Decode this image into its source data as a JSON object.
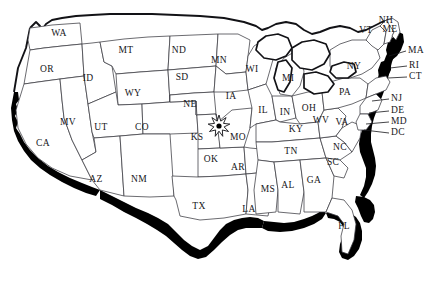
{
  "figure": {
    "kind": "map",
    "region": "Contiguous United States",
    "style": "black-and-white outline map with shaded coastal border band",
    "background_color": "#ffffff",
    "border_color": "#3a3a40",
    "outline_color": "#121216",
    "shade_color": "#000000",
    "label_color": "#16161a"
  },
  "watermark": {
    "text": "",
    "visible": true
  },
  "marker": {
    "name": "starburst-marker",
    "shape": "star-burst with filled center dot",
    "label": "",
    "near": "KS / MO border",
    "x": 219,
    "y": 126,
    "dot_color": "#000000"
  },
  "states": [
    {
      "code": "WA",
      "x": 59,
      "y": 34
    },
    {
      "code": "OR",
      "x": 47,
      "y": 70
    },
    {
      "code": "ID",
      "x": 88,
      "y": 79
    },
    {
      "code": "MT",
      "x": 126,
      "y": 51
    },
    {
      "code": "ND",
      "x": 179,
      "y": 51
    },
    {
      "code": "SD",
      "x": 182,
      "y": 78
    },
    {
      "code": "NE",
      "x": 190,
      "y": 105
    },
    {
      "code": "WY",
      "x": 133,
      "y": 94
    },
    {
      "code": "MV",
      "x": 68,
      "y": 123
    },
    {
      "code": "UT",
      "x": 101,
      "y": 128
    },
    {
      "code": "CO",
      "x": 142,
      "y": 128
    },
    {
      "code": "CA",
      "x": 43,
      "y": 144
    },
    {
      "code": "AZ",
      "x": 96,
      "y": 180
    },
    {
      "code": "NM",
      "x": 139,
      "y": 180
    },
    {
      "code": "KS",
      "x": 197,
      "y": 138
    },
    {
      "code": "OK",
      "x": 211,
      "y": 160
    },
    {
      "code": "TX",
      "x": 199,
      "y": 207
    },
    {
      "code": "MN",
      "x": 219,
      "y": 61
    },
    {
      "code": "IA",
      "x": 231,
      "y": 97
    },
    {
      "code": "MO",
      "x": 238,
      "y": 138
    },
    {
      "code": "AR",
      "x": 238,
      "y": 168
    },
    {
      "code": "LA",
      "x": 249,
      "y": 210
    },
    {
      "code": "WI",
      "x": 252,
      "y": 70
    },
    {
      "code": "IL",
      "x": 263,
      "y": 111
    },
    {
      "code": "MI",
      "x": 288,
      "y": 79
    },
    {
      "code": "IN",
      "x": 285,
      "y": 113
    },
    {
      "code": "OH",
      "x": 309,
      "y": 109
    },
    {
      "code": "KY",
      "x": 296,
      "y": 130
    },
    {
      "code": "TN",
      "x": 291,
      "y": 152
    },
    {
      "code": "MS",
      "x": 268,
      "y": 190
    },
    {
      "code": "AL",
      "x": 288,
      "y": 186
    },
    {
      "code": "GA",
      "x": 314,
      "y": 181
    },
    {
      "code": "FL",
      "x": 344,
      "y": 227
    },
    {
      "code": "SC",
      "x": 333,
      "y": 163
    },
    {
      "code": "NC",
      "x": 340,
      "y": 148
    },
    {
      "code": "WV",
      "x": 321,
      "y": 121
    },
    {
      "code": "VA",
      "x": 342,
      "y": 123
    },
    {
      "code": "PA",
      "x": 345,
      "y": 93
    },
    {
      "code": "NY",
      "x": 354,
      "y": 67
    },
    {
      "code": "VT",
      "x": 366,
      "y": 31
    },
    {
      "code": "NH",
      "x": 386,
      "y": 21
    },
    {
      "code": "ME",
      "x": 390,
      "y": 30
    }
  ],
  "callouts": [
    {
      "code": "MA",
      "label_x": 408,
      "label_y": 51,
      "leader": "M 406 51 L 389 56"
    },
    {
      "code": "RI",
      "label_x": 409,
      "label_y": 66,
      "leader": "M 407 66 L 390 68"
    },
    {
      "code": "CT",
      "label_x": 409,
      "label_y": 77,
      "leader": "M 407 77 L 388 78"
    },
    {
      "code": "NJ",
      "label_x": 391,
      "label_y": 99,
      "leader": "M 389 99 L 372 101"
    },
    {
      "code": "DE",
      "label_x": 391,
      "label_y": 111,
      "leader": "M 389 111 L 369 113"
    },
    {
      "code": "MD",
      "label_x": 391,
      "label_y": 122,
      "leader": "M 389 122 L 366 124"
    },
    {
      "code": "DC",
      "label_x": 391,
      "label_y": 133,
      "leader": "M 389 133 L 364 130"
    }
  ],
  "chart_data": {
    "type": "map",
    "title": "",
    "projection": "generic US contiguous outline",
    "label_count": 49,
    "labels": [
      "WA",
      "OR",
      "ID",
      "MT",
      "ND",
      "SD",
      "NE",
      "WY",
      "MV",
      "UT",
      "CO",
      "CA",
      "AZ",
      "NM",
      "KS",
      "OK",
      "TX",
      "MN",
      "IA",
      "MO",
      "AR",
      "LA",
      "WI",
      "IL",
      "MI",
      "IN",
      "OH",
      "KY",
      "TN",
      "MS",
      "AL",
      "GA",
      "FL",
      "SC",
      "NC",
      "WV",
      "VA",
      "PA",
      "NY",
      "VT",
      "NH",
      "ME",
      "MA",
      "RI",
      "CT",
      "NJ",
      "DE",
      "MD",
      "DC"
    ]
  }
}
